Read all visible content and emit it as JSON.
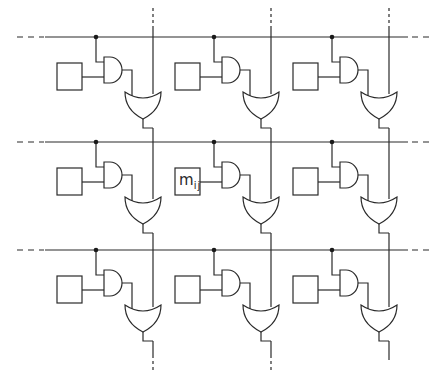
{
  "diagram": {
    "title": "",
    "rows": 3,
    "columns": 3,
    "cell_label": {
      "main": "m",
      "subscript": "ij",
      "row": 1,
      "column": 1
    },
    "components": {
      "memory_cell": "box",
      "and_gate": "and-gate",
      "or_gate": "or-gate",
      "junction": "junction-dot"
    },
    "colors": {
      "line": "#2a2a2a",
      "background": "#ffffff"
    }
  }
}
